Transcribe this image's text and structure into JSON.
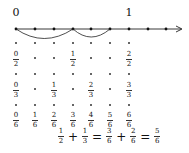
{
  "number_line": {
    "label_zero": "0",
    "label_one": "1",
    "points_x": [
      16,
      35,
      54,
      73,
      91,
      110,
      129,
      148,
      166
    ],
    "arc1": {
      "from": 0,
      "to": 3,
      "meaning": "1/2"
    },
    "arc2": {
      "from": 3,
      "to": 5,
      "meaning": "1/3"
    }
  },
  "rows": [
    {
      "name": "halves",
      "fractions": [
        {
          "col": 0,
          "num": "0",
          "den": "2"
        },
        {
          "col": 3,
          "num": "1",
          "den": "2"
        },
        {
          "col": 6,
          "num": "2",
          "den": "2"
        }
      ]
    },
    {
      "name": "thirds",
      "fractions": [
        {
          "col": 0,
          "num": "0",
          "den": "3"
        },
        {
          "col": 2,
          "num": "1",
          "den": "3"
        },
        {
          "col": 4,
          "num": "2",
          "den": "3"
        },
        {
          "col": 6,
          "num": "3",
          "den": "3"
        }
      ]
    },
    {
      "name": "sixths",
      "fractions": [
        {
          "col": 0,
          "num": "0",
          "den": "6"
        },
        {
          "col": 1,
          "num": "1",
          "den": "6"
        },
        {
          "col": 2,
          "num": "2",
          "den": "6"
        },
        {
          "col": 3,
          "num": "3",
          "den": "6"
        },
        {
          "col": 4,
          "num": "4",
          "den": "6"
        },
        {
          "col": 5,
          "num": "5",
          "den": "6"
        },
        {
          "col": 6,
          "num": "6",
          "den": "6"
        }
      ]
    }
  ],
  "equation": {
    "t1": {
      "num": "1",
      "den": "2"
    },
    "op1": "+",
    "t2": {
      "num": "1",
      "den": "3"
    },
    "op2": "=",
    "t3": {
      "num": "3",
      "den": "6"
    },
    "op3": "+",
    "t4": {
      "num": "2",
      "den": "6"
    },
    "op4": "=",
    "t5": {
      "num": "5",
      "den": "6"
    }
  }
}
